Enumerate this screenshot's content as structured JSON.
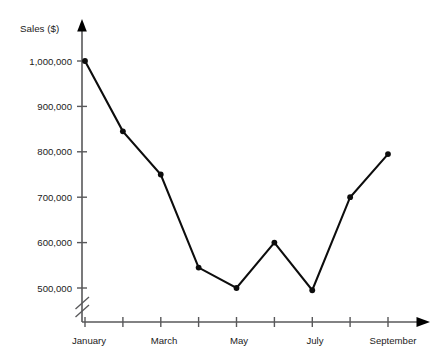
{
  "chart_data": {
    "type": "line",
    "title": "",
    "xlabel": "",
    "ylabel": "Sales ($)",
    "categories": [
      "January",
      "February",
      "March",
      "April",
      "May",
      "June",
      "July",
      "August",
      "September"
    ],
    "x_tick_labels": [
      "January",
      "",
      "March",
      "",
      "May",
      "",
      "July",
      "",
      "September"
    ],
    "values": [
      1000000,
      845000,
      750000,
      545000,
      500000,
      600000,
      495000,
      700000,
      795000
    ],
    "y_tick_labels": [
      "1,000,000",
      "900,000",
      "800,000",
      "700,000",
      "600,000",
      "500,000"
    ],
    "y_tick_values": [
      1000000,
      900000,
      800000,
      700000,
      600000,
      500000
    ],
    "ylim": [
      460000,
      1040000
    ],
    "axis_break": true,
    "axis_break_note": "broken y-axis below 500,000",
    "grid": false,
    "legend": false,
    "legend_position": "none",
    "markers": "filled-circle",
    "line_color": "#0d0d0d",
    "axis_color": "#58585a",
    "background_color": "#ffffff"
  },
  "axes": {
    "y_axis_label": "Sales ($)",
    "y_ticks": [
      {
        "label": "1,000,000",
        "value": 1000000
      },
      {
        "label": "900,000",
        "value": 900000
      },
      {
        "label": "800,000",
        "value": 800000
      },
      {
        "label": "700,000",
        "value": 700000
      },
      {
        "label": "600,000",
        "value": 600000
      },
      {
        "label": "500,000",
        "value": 500000
      }
    ],
    "x_ticks": [
      {
        "label": "January",
        "index": 1
      },
      {
        "label": "",
        "index": 2
      },
      {
        "label": "March",
        "index": 3
      },
      {
        "label": "",
        "index": 4
      },
      {
        "label": "May",
        "index": 5
      },
      {
        "label": "",
        "index": 6
      },
      {
        "label": "July",
        "index": 7
      },
      {
        "label": "",
        "index": 8
      },
      {
        "label": "September",
        "index": 9
      }
    ]
  }
}
